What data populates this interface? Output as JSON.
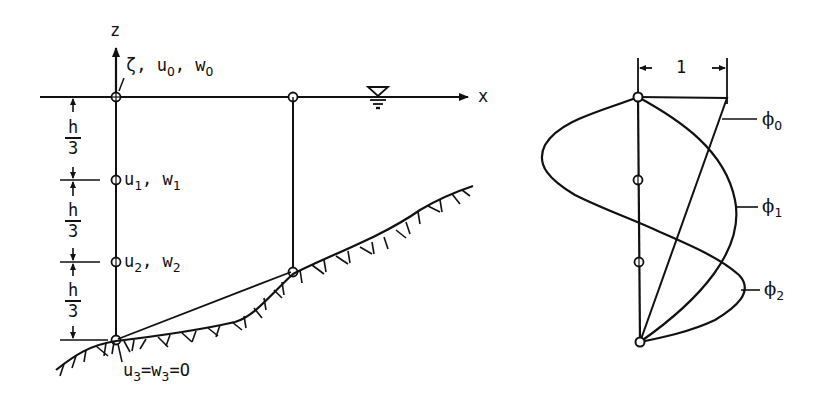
{
  "left_panel": {
    "axes": {
      "z_label": "z",
      "x_label": "x"
    },
    "surface_node_labels": {
      "zeta": "ζ",
      "sep1": ",",
      "u": "u",
      "u_sub": "O",
      "sep2": ",",
      "w": "w",
      "w_sub": "O"
    },
    "layer1_labels": {
      "u": "u",
      "u_sub": "1",
      "sep": ",",
      "w": "w",
      "w_sub": "1"
    },
    "layer2_labels": {
      "u": "u",
      "u_sub": "2",
      "sep": ",",
      "w": "w",
      "w_sub": "2"
    },
    "bottom_condition": {
      "u": "u",
      "u_sub": "3",
      "eq1": "=",
      "w": "w",
      "w_sub": "3",
      "eq2": "=O"
    },
    "spacing": [
      {
        "num": "h",
        "den": "3"
      },
      {
        "num": "h",
        "den": "3"
      },
      {
        "num": "h",
        "den": "3"
      }
    ],
    "water_surface_symbol": "free-surface-triangle"
  },
  "right_panel": {
    "scale_label": "1",
    "mode_labels": [
      {
        "symbol": "ϕ",
        "sub": "O"
      },
      {
        "symbol": "ϕ",
        "sub": "1"
      },
      {
        "symbol": "ϕ",
        "sub": "2"
      }
    ]
  },
  "colors": {
    "ink": "#111111",
    "background": "#ffffff"
  }
}
